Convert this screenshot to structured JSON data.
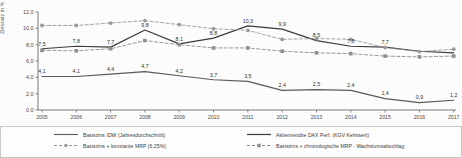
{
  "chart_data": {
    "type": "line",
    "title": "",
    "xlabel": "",
    "ylabel": "Zinssatz in %",
    "ylim": [
      0,
      12.0
    ],
    "yticks": [
      "0,0",
      "2,0",
      "4,0",
      "6,0",
      "8,0",
      "10,0",
      "12,0"
    ],
    "ytick_values": [
      0,
      2,
      4,
      6,
      8,
      10,
      12
    ],
    "grid": false,
    "legend_position": "bottom",
    "categories": [
      2005,
      2006,
      2007,
      2008,
      2009,
      2010,
      2011,
      2012,
      2013,
      2014,
      2015,
      2016,
      2017
    ],
    "xticks": [
      "2005",
      "2006",
      "2007",
      "2008",
      "2009",
      "2010",
      "2011",
      "2012",
      "2013",
      "2014",
      "2015",
      "2016",
      "2017"
    ],
    "series": [
      {
        "name": "Basiszins IDW (Jahresdurchschnitt)",
        "style": "solid",
        "color": "#5a5a5a",
        "marker": "none",
        "labelled": true,
        "values": [
          4.1,
          4.1,
          4.4,
          4.7,
          4.2,
          3.7,
          3.5,
          2.4,
          2.5,
          2.4,
          1.4,
          0.9,
          1.2
        ],
        "labels": [
          "4,1",
          "4,1",
          "4,4",
          "4,7",
          "4,2",
          "3,7",
          "3,5",
          "2,4",
          "2,5",
          "2,4",
          "1,4",
          "0,9",
          "1,2"
        ]
      },
      {
        "name": "Aktienrendite DAX Perf. (KGV Kehrwert)",
        "style": "solid",
        "color": "#3a3a3a",
        "marker": "none",
        "labelled": true,
        "values": [
          7.5,
          7.8,
          7.7,
          9.8,
          8.1,
          8.8,
          10.3,
          9.9,
          8.5,
          7.8,
          7.7,
          7.2,
          7.0
        ],
        "labels": [
          "7,5",
          "7,8",
          "7,7",
          "9,8",
          "8,1",
          "8,8",
          "10,3",
          "9,9",
          "8,5",
          "7,8",
          "7,7",
          "",
          ""
        ]
      },
      {
        "name": "Basiszins + konstante MRP (6,25%)",
        "style": "dashed",
        "color": "#9a9a9a",
        "marker": "circle",
        "labelled": false,
        "values": [
          10.35,
          10.35,
          10.65,
          10.95,
          10.45,
          9.95,
          9.75,
          8.65,
          8.75,
          8.65,
          7.65,
          7.15,
          7.45
        ]
      },
      {
        "name": "Basiszins + chronologische MRP - Wachstumsabschlag",
        "style": "dashed",
        "color": "#8f8f8f",
        "marker": "square",
        "labelled": false,
        "values": [
          7.3,
          7.25,
          7.5,
          8.5,
          8.0,
          7.6,
          7.6,
          7.2,
          7.0,
          6.9,
          6.6,
          6.5,
          6.6
        ]
      }
    ]
  },
  "axis": {
    "y_label": "Zinssatz in %"
  },
  "legend": {
    "items": [
      {
        "label": "Basiszins IDW (Jahresdurchschnitt)",
        "swatch": "solid-line-swatch",
        "color": "#5a5a5a"
      },
      {
        "label": "Aktienrendite DAX Perf. (KGV Kehrwert)",
        "swatch": "solid-line-swatch",
        "color": "#3a3a3a"
      },
      {
        "label": "Basiszins + konstante MRP (6,25%)",
        "swatch": "dashed-circle-line-swatch",
        "color": "#9a9a9a"
      },
      {
        "label": "Basiszins + chronologische MRP - Wachstumsabschlag",
        "swatch": "dashed-square-line-swatch",
        "color": "#8f8f8f"
      }
    ]
  }
}
